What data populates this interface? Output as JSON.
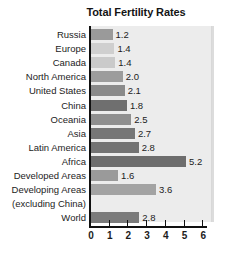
{
  "chart_data": {
    "type": "bar",
    "title": "Total Fertility Rates",
    "xlabel": "",
    "ylabel": "",
    "orientation": "horizontal",
    "xlim": [
      0,
      6
    ],
    "xticks": [
      0,
      1,
      2,
      3,
      4,
      5,
      6
    ],
    "xticklabels": [
      "0",
      "1",
      "2",
      "3",
      "4",
      "5",
      "6"
    ],
    "grid": false,
    "legend": "none",
    "categories": [
      "Russia",
      "Europe",
      "Canada",
      "North America",
      "United States",
      "China",
      "Oceania",
      "Asia",
      "Latin America",
      "Africa",
      "Developed Areas",
      "Developing Areas (excluding China)",
      "World"
    ],
    "values": [
      1.2,
      1.4,
      1.4,
      2.0,
      2.1,
      1.8,
      2.5,
      2.7,
      2.8,
      5.2,
      1.6,
      3.6,
      2.8
    ],
    "value_labels": [
      "1.2",
      "1.4",
      "1.4",
      "2.0",
      "2.1",
      "1.8",
      "2.5",
      "2.7",
      "2.8",
      "5.2",
      "1.6",
      "3.6",
      "2.8"
    ],
    "bar_colors": [
      "#9a9a9a",
      "#cfcfcf",
      "#cacaca",
      "#9c9c9c",
      "#8a8a8a",
      "#6f6f6f",
      "#8f8f8f",
      "#767676",
      "#737373",
      "#6d6d6d",
      "#9a9a9a",
      "#a3a3a3",
      "#7b7b7b"
    ],
    "panel_color": "#ececec",
    "axis_color": "#111111",
    "text_color": "#1c1c1c"
  },
  "rows": [
    {
      "label": "Russia",
      "label2": "",
      "value": "1.2",
      "bar_units": 1.15,
      "color": "#9a9a9a"
    },
    {
      "label": "Europe",
      "label2": "",
      "value": "1.4",
      "bar_units": 1.25,
      "color": "#cfcfcf"
    },
    {
      "label": "Canada",
      "label2": "",
      "value": "1.4",
      "bar_units": 1.3,
      "color": "#cacaca"
    },
    {
      "label": "North America",
      "label2": "",
      "value": "2.0",
      "bar_units": 1.7,
      "color": "#9c9c9c"
    },
    {
      "label": "United States",
      "label2": "",
      "value": "2.1",
      "bar_units": 1.8,
      "color": "#8a8a8a"
    },
    {
      "label": "China",
      "label2": "",
      "value": "1.8",
      "bar_units": 1.92,
      "color": "#6f6f6f"
    },
    {
      "label": "Oceania",
      "label2": "",
      "value": "2.5",
      "bar_units": 2.15,
      "color": "#8f8f8f"
    },
    {
      "label": "Asia",
      "label2": "",
      "value": "2.7",
      "bar_units": 2.35,
      "color": "#767676"
    },
    {
      "label": "Latin America",
      "label2": "",
      "value": "2.8",
      "bar_units": 2.55,
      "color": "#737373"
    },
    {
      "label": "Africa",
      "label2": "",
      "value": "5.2",
      "bar_units": 5.08,
      "color": "#6d6d6d"
    },
    {
      "label": "Developed Areas",
      "label2": "",
      "value": "1.6",
      "bar_units": 1.45,
      "color": "#9a9a9a"
    },
    {
      "label": "Developing Areas",
      "label2": "(excluding China)",
      "value": "3.6",
      "bar_units": 3.48,
      "color": "#a3a3a3"
    },
    {
      "label": "World",
      "label2": "",
      "value": "2.8",
      "bar_units": 2.58,
      "color": "#7b7b7b"
    }
  ]
}
